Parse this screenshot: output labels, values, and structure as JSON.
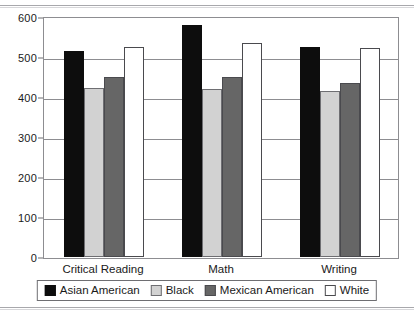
{
  "chart_data": {
    "type": "bar",
    "title": "",
    "xlabel": "",
    "ylabel": "",
    "ylim": [
      0,
      600
    ],
    "yticks": [
      0,
      100,
      200,
      300,
      400,
      500,
      600
    ],
    "ytick_labels": [
      "0",
      "100",
      "200",
      "300",
      "400",
      "500",
      "600"
    ],
    "grid": "horizontal",
    "legend_position": "bottom",
    "categories": [
      "Critical Reading",
      "Math",
      "Writing"
    ],
    "series": [
      {
        "name": "Asian American",
        "color": "#0d0d0d",
        "values": [
          515,
          580,
          525
        ]
      },
      {
        "name": "Black",
        "color": "#d2d2d2",
        "values": [
          423,
          420,
          415
        ]
      },
      {
        "name": "Mexican American",
        "color": "#666666",
        "values": [
          450,
          450,
          435
        ]
      },
      {
        "name": "White",
        "color": "#ffffff",
        "values": [
          525,
          535,
          522
        ]
      }
    ]
  },
  "legend": {
    "items": [
      {
        "label": "Asian American"
      },
      {
        "label": "Black"
      },
      {
        "label": "Mexican American"
      },
      {
        "label": "White"
      }
    ]
  }
}
